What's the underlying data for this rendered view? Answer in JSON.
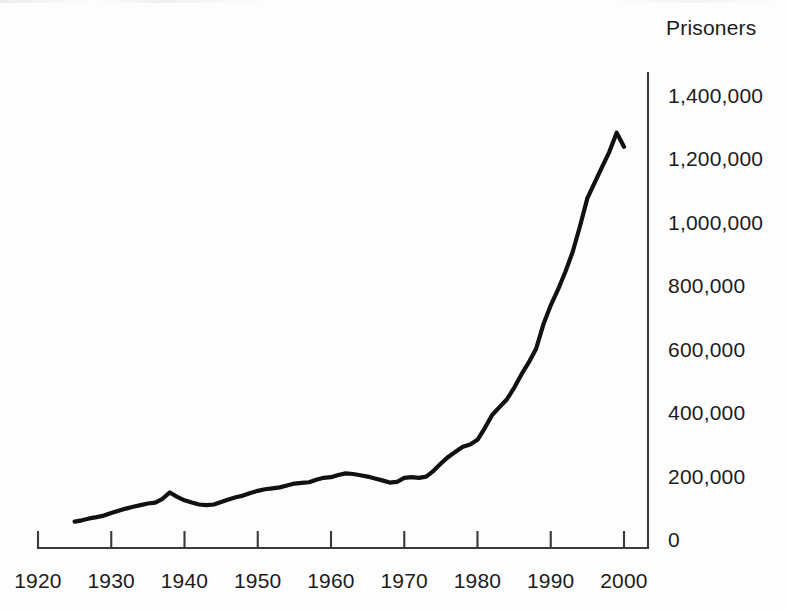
{
  "chart_data": {
    "type": "line",
    "title": "Prisoners",
    "xlabel": "",
    "ylabel": "Prisoners",
    "xlim": [
      1920,
      2002
    ],
    "ylim": [
      0,
      1450000
    ],
    "grid": false,
    "legend": "none",
    "x_ticks": [
      "1920",
      "1930",
      "1940",
      "1950",
      "1960",
      "1970",
      "1980",
      "1990",
      "2000"
    ],
    "x_tick_values": [
      1920,
      1930,
      1940,
      1950,
      1960,
      1970,
      1980,
      1990,
      2000
    ],
    "y_ticks": [
      "0",
      "200,000",
      "400,000",
      "600,000",
      "800,000",
      "1,000,000",
      "1,200,000",
      "1,400,000"
    ],
    "y_tick_values": [
      0,
      200000,
      400000,
      600000,
      800000,
      1000000,
      1200000,
      1400000
    ],
    "series": [
      {
        "name": "Prisoners",
        "color": "#111111",
        "x": [
          1925,
          1926,
          1927,
          1928,
          1929,
          1930,
          1931,
          1932,
          1933,
          1934,
          1935,
          1936,
          1937,
          1938,
          1939,
          1940,
          1941,
          1942,
          1943,
          1944,
          1945,
          1946,
          1947,
          1948,
          1949,
          1950,
          1951,
          1952,
          1953,
          1954,
          1955,
          1956,
          1957,
          1958,
          1959,
          1960,
          1961,
          1962,
          1963,
          1964,
          1965,
          1966,
          1967,
          1968,
          1969,
          1970,
          1971,
          1972,
          1973,
          1974,
          1975,
          1976,
          1977,
          1978,
          1979,
          1980,
          1981,
          1982,
          1983,
          1984,
          1985,
          1986,
          1987,
          1988,
          1989,
          1990,
          1991,
          1992,
          1993,
          1994,
          1995,
          1996,
          1997,
          1998,
          1999,
          2000
        ],
        "y": [
          58000,
          62000,
          68000,
          72000,
          77000,
          85000,
          92000,
          99000,
          105000,
          110000,
          115000,
          118000,
          130000,
          150000,
          136000,
          125000,
          118000,
          112000,
          110000,
          112000,
          120000,
          128000,
          135000,
          140000,
          148000,
          155000,
          160000,
          163000,
          166000,
          172000,
          178000,
          180000,
          182000,
          190000,
          196000,
          198000,
          205000,
          210000,
          208000,
          204000,
          200000,
          194000,
          188000,
          181000,
          183000,
          196000,
          198000,
          196000,
          200000,
          218000,
          241000,
          262000,
          278000,
          294000,
          301000,
          316000,
          353000,
          394000,
          419000,
          443000,
          480000,
          522000,
          560000,
          603000,
          680000,
          740000,
          790000,
          846000,
          909000,
          990000,
          1078000,
          1127000,
          1176000,
          1224000,
          1284000,
          1240000
        ]
      }
    ]
  },
  "axes": {
    "title_text": "Prisoners"
  }
}
